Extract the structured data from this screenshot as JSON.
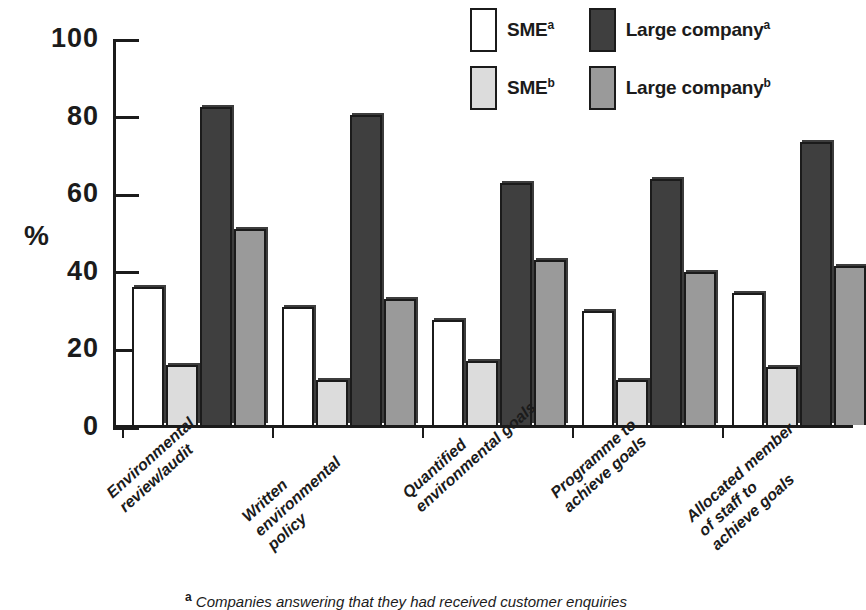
{
  "chart_data": {
    "type": "bar",
    "title": "",
    "xlabel": "",
    "ylabel": "%",
    "ylim": [
      0,
      100
    ],
    "ytick_labels": [
      "100",
      "80",
      "60",
      "40",
      "20",
      "0"
    ],
    "ytick_values": [
      100,
      80,
      60,
      40,
      20,
      0
    ],
    "grid": false,
    "legend_position": "top-center",
    "categories": [
      "Environmental\nreview/audit",
      "Written\nenvironmental\npolicy",
      "Quantified\nenvironmental goals",
      "Programme to\nachieve goals",
      "Allocated member\nof staff to\nachieve goals"
    ],
    "series": [
      {
        "name": "SMEa",
        "label": "SME",
        "sup": "a",
        "color": "#ffffff",
        "values": [
          35.5,
          30.5,
          27.0,
          29.5,
          34.0
        ]
      },
      {
        "name": "SMEb",
        "label": "SME",
        "sup": "b",
        "color": "#dcdcdc",
        "values": [
          15.5,
          11.5,
          16.5,
          11.5,
          15.0
        ]
      },
      {
        "name": "Large companya",
        "label": "Large company",
        "sup": "a",
        "color": "#3f3f3f",
        "values": [
          82.0,
          80.0,
          62.5,
          63.5,
          73.0
        ]
      },
      {
        "name": "Large companyb",
        "label": "Large company",
        "sup": "b",
        "color": "#9a9a9a",
        "values": [
          50.5,
          32.5,
          42.5,
          39.5,
          41.0
        ]
      }
    ],
    "series_draw_order": [
      "SMEa",
      "SMEb",
      "Large companya",
      "Large companyb"
    ]
  },
  "legend": {
    "items": [
      {
        "label": "SME",
        "sup": "a",
        "color": "#ffffff"
      },
      {
        "label": "Large company",
        "sup": "a",
        "color": "#3f3f3f"
      },
      {
        "label": "SME",
        "sup": "b",
        "color": "#dcdcdc"
      },
      {
        "label": "Large company",
        "sup": "b",
        "color": "#9a9a9a"
      }
    ]
  },
  "footnote": {
    "marker": "a",
    "text": " Companies answering that they had received customer enquiries"
  }
}
